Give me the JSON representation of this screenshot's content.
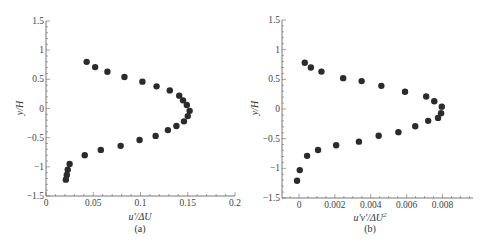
{
  "chart_data": [
    {
      "type": "scatter",
      "panel": "(a)",
      "title": "",
      "xlabel": "u'/ΔU",
      "ylabel": "y/H",
      "xlim": [
        0,
        0.2
      ],
      "ylim": [
        -1.5,
        1.5
      ],
      "xticks": [
        "0",
        "0.05",
        "0.1",
        "0.15",
        "0.2"
      ],
      "yticks": [
        "1.5",
        "1",
        "0.5",
        "0",
        "−0.5",
        "−1",
        "−1.5"
      ],
      "grid": false,
      "legend": null,
      "marker_color": "#2b2b2b",
      "x": [
        0.043,
        0.052,
        0.065,
        0.083,
        0.102,
        0.117,
        0.131,
        0.141,
        0.145,
        0.149,
        0.152,
        0.15,
        0.146,
        0.138,
        0.129,
        0.116,
        0.099,
        0.079,
        0.058,
        0.041,
        0.025,
        0.023,
        0.022,
        0.021
      ],
      "y": [
        0.8,
        0.71,
        0.63,
        0.54,
        0.46,
        0.38,
        0.31,
        0.22,
        0.14,
        0.06,
        -0.04,
        -0.13,
        -0.22,
        -0.3,
        -0.37,
        -0.47,
        -0.54,
        -0.64,
        -0.71,
        -0.8,
        -0.95,
        -1.05,
        -1.14,
        -1.22
      ]
    },
    {
      "type": "scatter",
      "panel": "(b)",
      "title": "",
      "xlabel": "u'v'/ΔU²",
      "ylabel": "y/H",
      "xlim": [
        -0.00095,
        0.0097
      ],
      "ylim": [
        -1.5,
        1.5
      ],
      "xticks": [
        "0",
        "0.002",
        "0.004",
        "0.006",
        "0.008"
      ],
      "yticks": [
        "1.5",
        "1",
        "0.5",
        "0",
        "−0.5",
        "−1",
        "−1.5"
      ],
      "grid": false,
      "legend": null,
      "marker_color": "#2b2b2b",
      "x": [
        0.00032,
        0.00066,
        0.00125,
        0.00246,
        0.00349,
        0.00459,
        0.00591,
        0.00709,
        0.00754,
        0.00796,
        0.00792,
        0.00775,
        0.0072,
        0.00648,
        0.00554,
        0.00444,
        0.00334,
        0.00207,
        0.00106,
        0.00045,
        4e-05,
        -0.00011
      ],
      "y": [
        0.78,
        0.7,
        0.63,
        0.52,
        0.47,
        0.39,
        0.29,
        0.21,
        0.13,
        0.04,
        -0.07,
        -0.15,
        -0.2,
        -0.29,
        -0.39,
        -0.45,
        -0.55,
        -0.61,
        -0.69,
        -0.79,
        -1.03,
        -1.21
      ]
    }
  ],
  "panels": {
    "a": {
      "xlabel": "u'/ΔU",
      "ylabel": "y/H",
      "caption": "(a)"
    },
    "b": {
      "xlabel_base": "u'v'/ΔU",
      "xlabel_sup": "2",
      "ylabel": "y/H",
      "caption": "(b)"
    }
  }
}
